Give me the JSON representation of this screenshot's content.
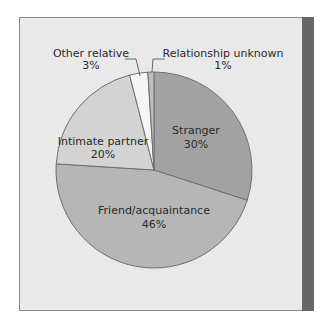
{
  "chart_data": {
    "type": "pie",
    "title": "",
    "slices": [
      {
        "label": "Stranger",
        "value": 30,
        "display": "30%",
        "color": "#a2a2a2"
      },
      {
        "label": "Friend/acquaintance",
        "value": 46,
        "display": "46%",
        "color": "#b6b6b6"
      },
      {
        "label": "Intimate partner",
        "value": 20,
        "display": "20%",
        "color": "#d3d3d3"
      },
      {
        "label": "Other relative",
        "value": 3,
        "display": "3%",
        "color": "#f5f5f5"
      },
      {
        "label": "Relationship unknown",
        "value": 1,
        "display": "1%",
        "color": "#bdbdbd"
      }
    ],
    "start_angle_deg": 0,
    "direction": "clockwise",
    "legend": "none (callout labels)"
  },
  "colors": {
    "panel_bg": "#e9e9e9",
    "side_bar": "#666666",
    "slice_border": "#6e6e6e"
  }
}
